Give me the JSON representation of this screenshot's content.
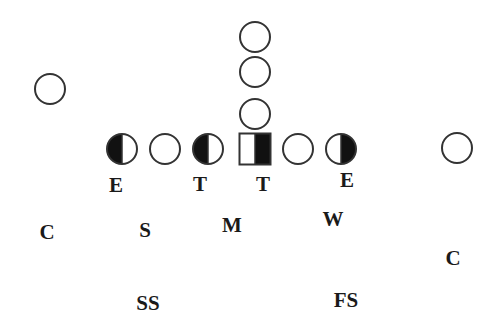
{
  "diagram": {
    "title": "",
    "colors": {
      "stroke": "#333333",
      "fill": "#111111",
      "background": "#ffffff"
    },
    "offense": [
      {
        "id": "back-1",
        "shape": "circle",
        "fill": "none",
        "cx": 255,
        "cy": 37,
        "r": 15
      },
      {
        "id": "back-2",
        "shape": "circle",
        "fill": "none",
        "cx": 255,
        "cy": 72,
        "r": 15
      },
      {
        "id": "back-3",
        "shape": "circle",
        "fill": "none",
        "cx": 255,
        "cy": 114,
        "r": 15
      },
      {
        "id": "wide-receiver-left",
        "shape": "circle",
        "fill": "none",
        "cx": 50,
        "cy": 89,
        "r": 15
      },
      {
        "id": "lineman-left-end",
        "shape": "circle",
        "fill": "left-half",
        "cx": 122,
        "cy": 149,
        "r": 15
      },
      {
        "id": "lineman-left-2",
        "shape": "circle",
        "fill": "none",
        "cx": 165,
        "cy": 149,
        "r": 15
      },
      {
        "id": "lineman-left-tackle",
        "shape": "circle",
        "fill": "left-half",
        "cx": 208,
        "cy": 149,
        "r": 15
      },
      {
        "id": "center",
        "shape": "square",
        "fill": "right-half",
        "cx": 255,
        "cy": 149,
        "size": 31
      },
      {
        "id": "lineman-right-2",
        "shape": "circle",
        "fill": "none",
        "cx": 298,
        "cy": 149,
        "r": 15
      },
      {
        "id": "lineman-right-end",
        "shape": "circle",
        "fill": "right-half",
        "cx": 341,
        "cy": 149,
        "r": 15
      },
      {
        "id": "wide-receiver-right",
        "shape": "circle",
        "fill": "none",
        "cx": 457,
        "cy": 148,
        "r": 15
      }
    ],
    "defense": [
      {
        "id": "defense-end-left",
        "label": "E",
        "x": 116,
        "y": 185
      },
      {
        "id": "defense-tackle-left",
        "label": "T",
        "x": 200,
        "y": 184
      },
      {
        "id": "defense-tackle-right",
        "label": "T",
        "x": 263,
        "y": 184
      },
      {
        "id": "defense-end-right",
        "label": "E",
        "x": 347,
        "y": 180
      },
      {
        "id": "defense-corner-left",
        "label": "C",
        "x": 47,
        "y": 232
      },
      {
        "id": "defense-strong-lb",
        "label": "S",
        "x": 145,
        "y": 230
      },
      {
        "id": "defense-middle-lb",
        "label": "M",
        "x": 232,
        "y": 225
      },
      {
        "id": "defense-weak-lb",
        "label": "W",
        "x": 333,
        "y": 219
      },
      {
        "id": "defense-corner-right",
        "label": "C",
        "x": 453,
        "y": 258
      },
      {
        "id": "defense-strong-safety",
        "label": "SS",
        "x": 148,
        "y": 303
      },
      {
        "id": "defense-free-safety",
        "label": "FS",
        "x": 346,
        "y": 300
      }
    ]
  }
}
